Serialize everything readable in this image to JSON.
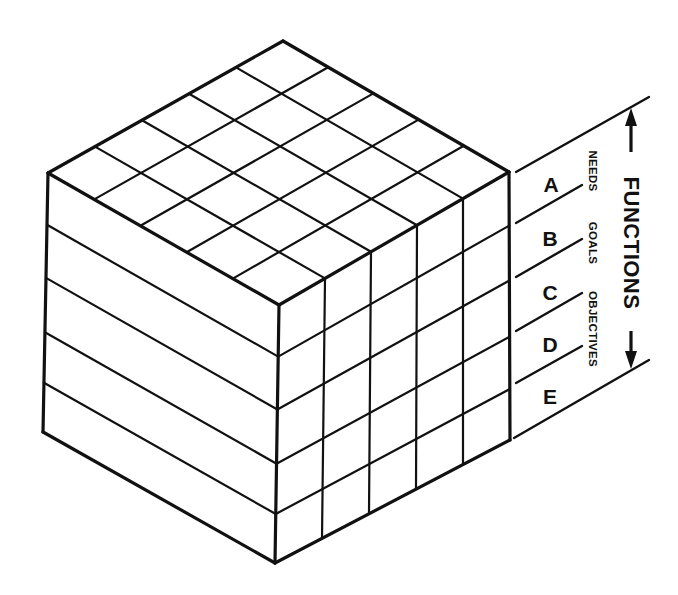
{
  "diagram": {
    "title": "FUNCTIONS",
    "levels": [
      {
        "letter": "A"
      },
      {
        "letter": "B"
      },
      {
        "letter": "C"
      },
      {
        "letter": "D"
      },
      {
        "letter": "E"
      }
    ],
    "level_names": [
      "NEEDS",
      "GOALS",
      "OBJECTIVES"
    ],
    "cube": {
      "grid_divisions": 5,
      "layer_count": 5,
      "layer_fractions": [
        0,
        0.2,
        0.405,
        0.615,
        0.81,
        1
      ]
    }
  }
}
